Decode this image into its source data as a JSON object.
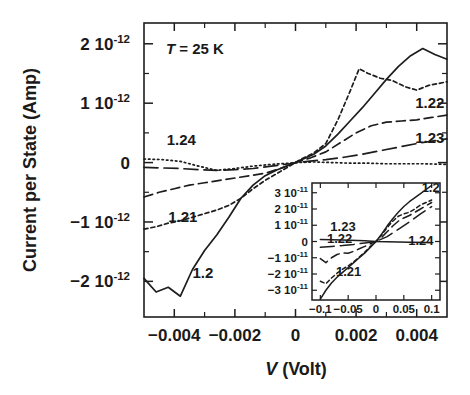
{
  "figure": {
    "title": "",
    "annotation": {
      "symbol": "T",
      "text": " = 25 K",
      "full": "T = 25 K"
    }
  },
  "axes": {
    "x": {
      "label_italic": "V",
      "label_rest": " (Volt)",
      "label_full": "V (Volt)",
      "ticks": [
        "-0.004",
        "-0.002",
        "0",
        "0.002",
        "0.004"
      ],
      "tick_values": [
        -0.004,
        -0.002,
        0,
        0.002,
        0.004
      ],
      "range": [
        -0.005,
        0.005
      ]
    },
    "y": {
      "label": "Current per State (Amp)",
      "ticks": [
        {
          "mantissa": "2 10",
          "exp": "-12"
        },
        {
          "mantissa": "1 10",
          "exp": "-12"
        },
        {
          "mantissa": "0",
          "exp": ""
        },
        {
          "mantissa": "−1 10",
          "exp": "-12"
        },
        {
          "mantissa": "−2 10",
          "exp": "-12"
        }
      ],
      "tick_values": [
        2e-12,
        1e-12,
        0,
        -1e-12,
        -2e-12
      ],
      "range": [
        -2.6e-12,
        2.35e-12
      ]
    }
  },
  "inset": {
    "x": {
      "ticks": [
        "-0.1",
        "-0.05",
        "0",
        "0.05",
        "0.1"
      ],
      "tick_values": [
        -0.1,
        -0.05,
        0,
        0.05,
        0.1
      ],
      "range": [
        -0.115,
        0.115
      ]
    },
    "y": {
      "ticks": [
        {
          "mantissa": "3 10",
          "exp": "-11"
        },
        {
          "mantissa": "2 10",
          "exp": "-11"
        },
        {
          "mantissa": "1 10",
          "exp": "-11"
        },
        {
          "mantissa": "0",
          "exp": ""
        },
        {
          "mantissa": "−1 10",
          "exp": "-11"
        },
        {
          "mantissa": "−2 10",
          "exp": "-11"
        },
        {
          "mantissa": "−3 10",
          "exp": "-11"
        }
      ],
      "tick_values": [
        3e-11,
        2e-11,
        1e-11,
        0,
        -1e-11,
        -2e-11,
        -3e-11
      ],
      "range": [
        -3.6e-11,
        3.6e-11
      ]
    },
    "curve_labels": [
      {
        "text": "1.2",
        "x": 0.082,
        "y": 3.05e-11
      },
      {
        "text": "1.23",
        "x": -0.082,
        "y": 6.2e-12
      },
      {
        "text": "1.22",
        "x": -0.088,
        "y": -1.2e-12
      },
      {
        "text": "1.24",
        "x": 0.058,
        "y": -2.2e-12
      },
      {
        "text": "1.21",
        "x": -0.072,
        "y": -2.15e-11
      }
    ]
  },
  "curve_labels": [
    {
      "text": "1.24",
      "x": -0.00425,
      "y": 3e-13
    },
    {
      "text": "1.21",
      "x": -0.0042,
      "y": -1e-12
    },
    {
      "text": "1.2",
      "x": -0.0034,
      "y": -1.95e-12
    },
    {
      "text": "1.22",
      "x": 0.00395,
      "y": 9.2e-13
    },
    {
      "text": "1.23",
      "x": 0.00395,
      "y": 3.3e-13
    }
  ],
  "chart_data": {
    "type": "line",
    "title": "",
    "xlabel": "V (Volt)",
    "ylabel": "Current per State (Amp)",
    "xlim": [
      -0.005,
      0.005
    ],
    "ylim": [
      -2.6e-12,
      2.35e-12
    ],
    "grid": false,
    "legend": "inline-curve-labels",
    "annotations": [
      "T = 25 K"
    ],
    "series": [
      {
        "name": "1.2",
        "style": "solid",
        "x": [
          -0.005,
          -0.0046,
          -0.0042,
          -0.0038,
          -0.0034,
          -0.003,
          -0.0026,
          -0.0022,
          -0.0018,
          -0.0014,
          -0.001,
          -0.0006,
          -0.0002,
          0.0,
          0.0002,
          0.0006,
          0.001,
          0.0014,
          0.0018,
          0.0022,
          0.0026,
          0.003,
          0.0034,
          0.0038,
          0.0042,
          0.0046,
          0.005
        ],
        "y": [
          -1.95e-12,
          -2.18e-12,
          -2.1e-12,
          -2.25e-12,
          -1.8e-12,
          -1.48e-12,
          -1.22e-12,
          -9.2e-13,
          -6e-13,
          -3.8e-13,
          -2.2e-13,
          -1.2e-13,
          -4e-14,
          0.0,
          5e-14,
          1.4e-13,
          2.8e-13,
          4.8e-13,
          7e-13,
          9.2e-13,
          1.16e-12,
          1.4e-12,
          1.62e-12,
          1.8e-12,
          1.92e-12,
          1.82e-12,
          1.74e-12
        ]
      },
      {
        "name": "1.21",
        "style": "dotted",
        "x": [
          -0.005,
          -0.0046,
          -0.0042,
          -0.0038,
          -0.0034,
          -0.003,
          -0.0026,
          -0.0022,
          -0.0018,
          -0.0014,
          -0.001,
          -0.0006,
          -0.0002,
          0.0,
          0.0002,
          0.0006,
          0.001,
          0.0014,
          0.0018,
          0.0021,
          0.0024,
          0.0028,
          0.0032,
          0.0036,
          0.004,
          0.0044,
          0.005
        ],
        "y": [
          -1.12e-12,
          -1.08e-12,
          -1.02e-12,
          -9.8e-13,
          -9.2e-13,
          -8.6e-13,
          -8e-13,
          -7.2e-13,
          -6e-13,
          -4.4e-13,
          -3e-13,
          -1.8e-13,
          -6e-14,
          0.0,
          6e-14,
          1.6e-13,
          3.2e-13,
          7.2e-13,
          1.2e-12,
          1.58e-12,
          1.5e-12,
          1.42e-12,
          1.38e-12,
          1.28e-12,
          1.22e-12,
          1.3e-12,
          1.36e-12
        ]
      },
      {
        "name": "1.22",
        "style": "dashed",
        "x": [
          -0.005,
          -0.0045,
          -0.004,
          -0.0035,
          -0.003,
          -0.0025,
          -0.002,
          -0.0015,
          -0.001,
          -0.0005,
          0.0,
          0.0005,
          0.001,
          0.0015,
          0.002,
          0.0025,
          0.003,
          0.0035,
          0.004,
          0.0045,
          0.005
        ],
        "y": [
          -5.8e-13,
          -5e-13,
          -4.4e-13,
          -3.8e-13,
          -3.4e-13,
          -3e-13,
          -2.6e-13,
          -2.2e-13,
          -1.8e-13,
          -1e-13,
          0.0,
          8e-14,
          1.8e-13,
          3.4e-13,
          5e-13,
          6.2e-13,
          6.8e-13,
          7e-13,
          7.2e-13,
          7.6e-13,
          8e-13
        ]
      },
      {
        "name": "1.23",
        "style": "longdash",
        "x": [
          -0.005,
          -0.0044,
          -0.0038,
          -0.0032,
          -0.0026,
          -0.002,
          -0.0014,
          -0.0008,
          -0.0002,
          0.0,
          0.0004,
          0.001,
          0.0016,
          0.0022,
          0.0028,
          0.0034,
          0.004,
          0.0046,
          0.005
        ],
        "y": [
          -8e-14,
          -9e-14,
          -1e-13,
          -1.2e-13,
          -1.3e-13,
          -1.2e-13,
          -1e-13,
          -6e-14,
          -2e-14,
          0.0,
          2e-14,
          5e-14,
          9e-14,
          1.4e-13,
          2e-13,
          2.6e-13,
          3.2e-13,
          3.7e-13,
          4e-13
        ]
      },
      {
        "name": "1.24",
        "style": "dashdot",
        "x": [
          -0.005,
          -0.0044,
          -0.0038,
          -0.0032,
          -0.0026,
          -0.002,
          -0.0014,
          -0.0008,
          -0.0002,
          0.0,
          0.0006,
          0.0012,
          0.0018,
          0.0024,
          0.003,
          0.0036,
          0.0042,
          0.005
        ],
        "y": [
          6e-14,
          5e-14,
          2e-14,
          -6e-14,
          -1.3e-13,
          -1e-13,
          -6e-14,
          -3e-14,
          -1e-14,
          0.0,
          1e-14,
          0.0,
          -1e-14,
          -1e-14,
          -2e-14,
          -2e-14,
          -2e-14,
          -3e-14
        ]
      }
    ],
    "inset_series": [
      {
        "name": "1.2",
        "style": "solid",
        "x": [
          -0.1,
          -0.09,
          -0.08,
          -0.07,
          -0.06,
          -0.05,
          -0.04,
          -0.03,
          -0.02,
          -0.01,
          0.0,
          0.01,
          0.02,
          0.03,
          0.04,
          0.05,
          0.06,
          0.07,
          0.08,
          0.09,
          0.1
        ],
        "y": [
          -3.55e-11,
          -3e-11,
          -2.55e-11,
          -2.2e-11,
          -1.9e-11,
          -1.6e-11,
          -1.3e-11,
          -1e-11,
          -7e-12,
          -3.5e-12,
          0.0,
          4.5e-12,
          9.5e-12,
          1.4e-11,
          1.8e-11,
          2.15e-11,
          2.45e-11,
          2.7e-11,
          2.95e-11,
          3.2e-11,
          3.45e-11
        ]
      },
      {
        "name": "1.21",
        "style": "dotted",
        "x": [
          -0.1,
          -0.09,
          -0.08,
          -0.07,
          -0.06,
          -0.05,
          -0.04,
          -0.03,
          -0.02,
          -0.01,
          0.0,
          0.01,
          0.02,
          0.03,
          0.04,
          0.05,
          0.06,
          0.07,
          0.08,
          0.09,
          0.1
        ],
        "y": [
          -2.45e-11,
          -2.6e-11,
          -2.25e-11,
          -1.95e-11,
          -1.7e-11,
          -1.5e-11,
          -1.25e-11,
          -9.5e-12,
          -6.5e-12,
          -3e-12,
          0.0,
          4e-12,
          8.5e-12,
          1.25e-11,
          1.55e-11,
          1.7e-11,
          1.8e-11,
          2e-11,
          2.25e-11,
          2.4e-11,
          2.55e-11
        ]
      },
      {
        "name": "1.22",
        "style": "dashed",
        "x": [
          -0.1,
          -0.09,
          -0.08,
          -0.07,
          -0.06,
          -0.05,
          -0.04,
          -0.03,
          -0.02,
          -0.01,
          0.0,
          0.01,
          0.02,
          0.03,
          0.04,
          0.05,
          0.06,
          0.07,
          0.08,
          0.09,
          0.1
        ],
        "y": [
          -1.05e-11,
          -1.3e-11,
          -1e-11,
          -8e-12,
          -7e-12,
          -7.2e-12,
          -6e-12,
          -4.5e-12,
          -3e-12,
          -1.4e-12,
          0.0,
          2.5e-12,
          6e-12,
          9.5e-12,
          1.25e-11,
          1.45e-11,
          1.6e-11,
          1.8e-11,
          2e-11,
          2.2e-11,
          2.4e-11
        ]
      },
      {
        "name": "1.23",
        "style": "longdash",
        "x": [
          -0.1,
          -0.08,
          -0.06,
          -0.04,
          -0.02,
          0.0,
          0.02,
          0.04,
          0.06,
          0.08,
          0.1
        ],
        "y": [
          -3.5e-12,
          -3e-12,
          -2.5e-12,
          -1.8e-12,
          -9e-13,
          0.0,
          3e-12,
          7.5e-12,
          1.2e-11,
          1.7e-11,
          2.15e-11
        ]
      },
      {
        "name": "1.24",
        "style": "flat",
        "x": [
          -0.1,
          -0.06,
          -0.02,
          0.0,
          0.02,
          0.06,
          0.1
        ],
        "y": [
          1.2e-12,
          1e-12,
          5e-13,
          0.0,
          -2e-13,
          -5e-13,
          -6e-13
        ]
      }
    ]
  }
}
